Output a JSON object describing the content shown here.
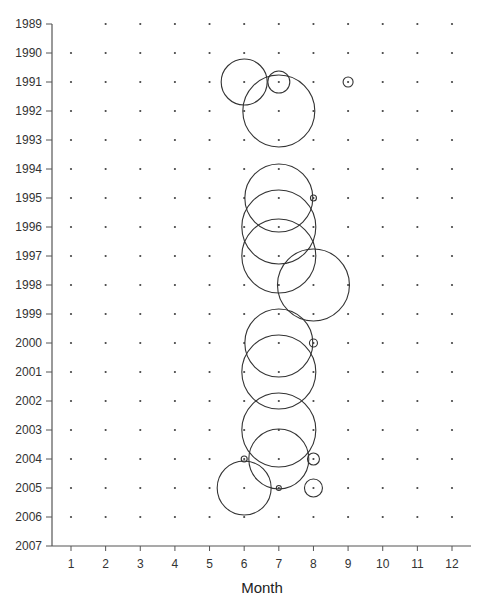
{
  "chart_data": {
    "type": "scatter",
    "subtype": "bubble",
    "title": "",
    "xlabel": "Month",
    "ylabel": "",
    "x_ticks": [
      1,
      2,
      3,
      4,
      5,
      6,
      7,
      8,
      9,
      10,
      11,
      12
    ],
    "y_ticks": [
      "1989",
      "1990",
      "1991",
      "1992",
      "1993",
      "1994",
      "1995",
      "1996",
      "1997",
      "1998",
      "1999",
      "2000",
      "2001",
      "2002",
      "2003",
      "2004",
      "2005",
      "2006",
      "2007"
    ],
    "xlim": [
      0.5,
      12.5
    ],
    "ylim": [
      1989,
      2007
    ],
    "y_inverted": true,
    "grid": "dots",
    "legend": "none",
    "dot_grid_missing": [
      [
        1,
        1989
      ]
    ],
    "bubbles": [
      {
        "month": 6,
        "year": 1991,
        "radius_px": 23
      },
      {
        "month": 7,
        "year": 1991,
        "radius_px": 11
      },
      {
        "month": 9,
        "year": 1991,
        "radius_px": 5
      },
      {
        "month": 7,
        "year": 1992,
        "radius_px": 36
      },
      {
        "month": 7,
        "year": 1995,
        "radius_px": 34
      },
      {
        "month": 8,
        "year": 1995,
        "radius_px": 3
      },
      {
        "month": 7,
        "year": 1996,
        "radius_px": 37
      },
      {
        "month": 7,
        "year": 1997,
        "radius_px": 37
      },
      {
        "month": 8,
        "year": 1998,
        "radius_px": 36
      },
      {
        "month": 7,
        "year": 2000,
        "radius_px": 34
      },
      {
        "month": 8,
        "year": 2000,
        "radius_px": 4
      },
      {
        "month": 7,
        "year": 2001,
        "radius_px": 37
      },
      {
        "month": 7,
        "year": 2003,
        "radius_px": 37
      },
      {
        "month": 6,
        "year": 2004,
        "radius_px": 3
      },
      {
        "month": 7,
        "year": 2004,
        "radius_px": 30
      },
      {
        "month": 8,
        "year": 2004,
        "radius_px": 6
      },
      {
        "month": 6,
        "year": 2005,
        "radius_px": 27
      },
      {
        "month": 7,
        "year": 2005,
        "radius_px": 2.5
      },
      {
        "month": 8,
        "year": 2005,
        "radius_px": 9
      }
    ]
  },
  "layout": {
    "axis_color": "#555555",
    "bubble_stroke": "#333333",
    "dot_color": "#444444"
  }
}
